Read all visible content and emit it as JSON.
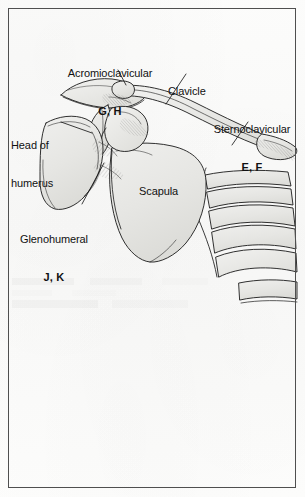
{
  "figure": {
    "page_background": "#fbfbfa",
    "border_color": "#3a3a3a",
    "bone_fill": "#e8e8e6",
    "ink_color": "#1a1a1a",
    "labels": [
      {
        "id": "acromioclavicular",
        "name": "Acromioclavicular",
        "code": "G, H"
      },
      {
        "id": "clavicle",
        "name": "Clavicle",
        "code": ""
      },
      {
        "id": "sternoclavicular",
        "name": "Sternoclavicular",
        "code": "E, F"
      },
      {
        "id": "head_of_humerus",
        "name_line1": "Head of",
        "name_line2": "humerus",
        "code": ""
      },
      {
        "id": "scapula",
        "name": "Scapula",
        "code": ""
      },
      {
        "id": "glenohumeral",
        "name": "Glenohumeral",
        "code": "J, K"
      }
    ]
  }
}
